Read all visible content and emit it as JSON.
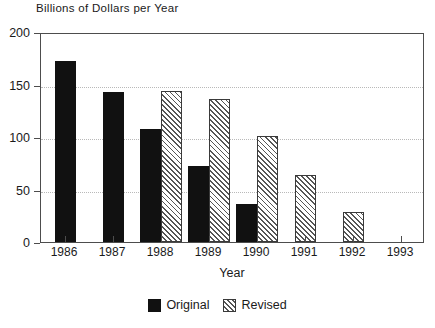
{
  "chart_data": {
    "type": "bar",
    "title": "Billions of Dollars per Year",
    "xlabel": "Year",
    "ylabel": "",
    "categories": [
      "1986",
      "1987",
      "1988",
      "1989",
      "1990",
      "1991",
      "1992",
      "1993"
    ],
    "series": [
      {
        "name": "Original",
        "values": [
          172,
          143,
          108,
          72,
          36,
          null,
          null,
          null
        ]
      },
      {
        "name": "Revised",
        "values": [
          null,
          null,
          144,
          136,
          101,
          64,
          29,
          null
        ]
      }
    ],
    "ylim": [
      0,
      200
    ],
    "yticks": [
      0,
      50,
      100,
      150,
      200
    ],
    "ytick_labels": [
      "0",
      "50",
      "100",
      "150",
      "200"
    ],
    "grid": true,
    "grid_axis": "y",
    "grid_style": "dotted",
    "legend_position": "bottom-center",
    "legend": [
      "Original",
      "Revised"
    ]
  },
  "colors": {
    "original": "#111111",
    "revised_hatch": "#555555",
    "frame": "#4d4d4d",
    "grid": "#b9b9b9",
    "background": "#ffffff",
    "text": "#1a1a1a"
  }
}
